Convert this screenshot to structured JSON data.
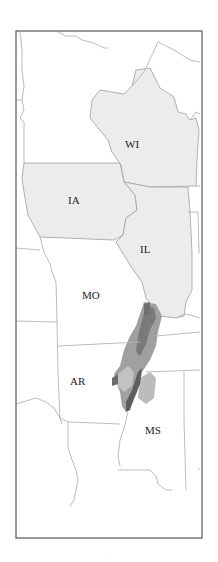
{
  "map": {
    "type": "state outline map (upper Mississippi to lower Mississippi valley)",
    "labels": [
      {
        "id": "WI",
        "text": "WI",
        "x": 125,
        "y": 148
      },
      {
        "id": "IA",
        "text": "IA",
        "x": 68,
        "y": 204
      },
      {
        "id": "IL",
        "text": "IL",
        "x": 140,
        "y": 253
      },
      {
        "id": "MO",
        "text": "MO",
        "x": 82,
        "y": 299
      },
      {
        "id": "AR",
        "text": "AR",
        "x": 70,
        "y": 385
      },
      {
        "id": "MS",
        "text": "MS",
        "x": 145,
        "y": 434
      }
    ],
    "highlighted_states": [
      "WI",
      "IA",
      "IL"
    ],
    "colors": {
      "highlight_fill": "#ececec",
      "border": "#b4b4b4",
      "frame": "#555555",
      "density_dark": "#5a5a5a",
      "density_mid": "#8a8a8a",
      "density_light": "#b8b8b8"
    },
    "density_region": "Mississippi alluvial valley (shaded in gray tones from southern IL/MO bootheel through AR/MS delta)"
  },
  "caption": "..."
}
